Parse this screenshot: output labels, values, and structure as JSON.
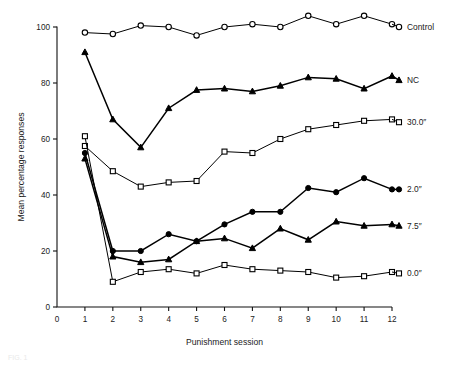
{
  "chart_data": {
    "type": "line",
    "title": "",
    "xlabel": "Punishment session",
    "ylabel": "Mean percentage responses",
    "x": [
      1,
      2,
      3,
      4,
      5,
      6,
      7,
      8,
      9,
      10,
      11,
      12
    ],
    "xlim": [
      0,
      12
    ],
    "ylim": [
      0,
      100
    ],
    "xticks": [
      "0",
      "1",
      "2",
      "3",
      "4",
      "5",
      "6",
      "7",
      "8",
      "9",
      "10",
      "11",
      "12"
    ],
    "yticks": [
      "0",
      "20",
      "40",
      "60",
      "80",
      "100"
    ],
    "grid": false,
    "legend_position": "right-of-axes-inline",
    "series": [
      {
        "name": "Control",
        "marker": "open-circle",
        "values": [
          98,
          97.5,
          100.5,
          100,
          97,
          100,
          101,
          100,
          104,
          101,
          104,
          101
        ]
      },
      {
        "name": "NC",
        "marker": "filled-triangle",
        "values": [
          91,
          67,
          57,
          71,
          77.5,
          78,
          77,
          79,
          82,
          81.5,
          78,
          82.5
        ]
      },
      {
        "name": "30.0″",
        "marker": "open-square",
        "values": [
          57.5,
          48.5,
          43,
          44.5,
          45,
          55.5,
          55,
          60,
          63.5,
          65,
          66.5,
          67
        ]
      },
      {
        "name": "2.0″",
        "marker": "filled-circle",
        "values": [
          55,
          20,
          20,
          26,
          23.5,
          29.5,
          34,
          34,
          42.5,
          41,
          46,
          42
        ]
      },
      {
        "name": "7.5″",
        "marker": "filled-triangle",
        "values": [
          53,
          18,
          16,
          17,
          23.5,
          24.5,
          21,
          28,
          24,
          30.5,
          29,
          29.5
        ]
      },
      {
        "name": "0.0″",
        "marker": "open-square",
        "values": [
          61,
          9,
          12.5,
          13.5,
          12,
          15,
          13.5,
          13,
          12.5,
          10.5,
          11,
          12.5
        ]
      }
    ],
    "series_label_y": [
      100,
      81,
      66,
      42,
      29,
      12
    ]
  },
  "caption": {
    "partial_text": "FIG. 1"
  }
}
